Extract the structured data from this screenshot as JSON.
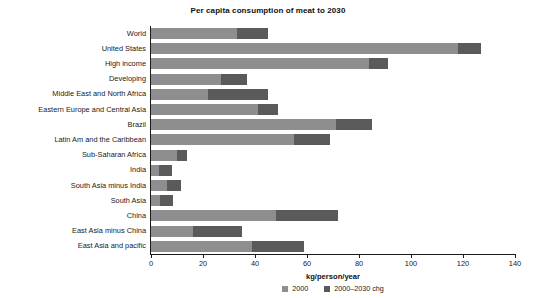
{
  "chart_data": {
    "type": "bar",
    "orientation": "horizontal",
    "stacked": true,
    "title": "Per capita consumption of meat to 2030",
    "xlabel": "kg/person/year",
    "ylabel": "",
    "xlim": [
      0,
      140
    ],
    "xticks": [
      0,
      20,
      40,
      60,
      80,
      100,
      120,
      140
    ],
    "grid": false,
    "legend_position": "bottom",
    "colors": {
      "2000": "#8e8e8e",
      "2000-2030 chg": "#5a5a5a",
      "axis": "#1a1a1a",
      "background": "#ffffff"
    },
    "categories": [
      "World",
      "United States",
      "High income",
      "Developing",
      "Middle East and North Africa",
      "Eastern Europe and Central Asia",
      "Brazil",
      "Latin Am and the Caribbean",
      "Sub-Saharan Africa",
      "India",
      "South Asia minus India",
      "South Asia",
      "China",
      "East Asia minus China",
      "East Asia and pacific"
    ],
    "series": [
      {
        "name": "2000",
        "values": [
          33,
          118,
          84,
          27,
          22,
          41,
          71,
          55,
          10,
          3,
          6,
          3.5,
          48,
          16,
          39
        ]
      },
      {
        "name": "2000-2030 chg",
        "values": [
          12,
          9,
          7,
          10,
          23,
          8,
          14,
          14,
          4,
          5,
          5.5,
          5,
          24,
          19,
          20
        ]
      }
    ],
    "totals": [
      45,
      127,
      91,
      37,
      45,
      49,
      85,
      69,
      14,
      8,
      11.5,
      8.5,
      72,
      35,
      59
    ],
    "legend": [
      {
        "label": "2000"
      },
      {
        "label": "2000–2030 chg"
      }
    ]
  }
}
